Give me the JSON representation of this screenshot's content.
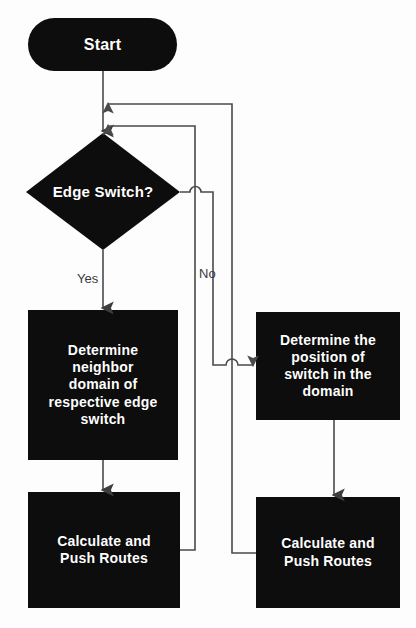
{
  "diagram": {
    "background_color": "#fdfdfd",
    "node_fill_color": "#0d0d0d",
    "node_text_color": "#ffffff",
    "connector_color": "#4a4a4a"
  },
  "nodes": {
    "start": {
      "label": "Start",
      "shape": "stadium"
    },
    "decision": {
      "label": "Edge Switch?",
      "shape": "diamond"
    },
    "determine_neighbor": {
      "label": "Determine\nneighbor\ndomain of\nrespective edge\nswitch",
      "shape": "rectangle"
    },
    "determine_position": {
      "label": "Determine the\nposition of\nswitch in the\ndomain",
      "shape": "rectangle"
    },
    "calculate_left": {
      "label": "Calculate and\nPush Routes",
      "shape": "rectangle"
    },
    "calculate_right": {
      "label": "Calculate and\nPush Routes",
      "shape": "rectangle"
    }
  },
  "edge_labels": {
    "yes": "Yes",
    "no": "No"
  }
}
